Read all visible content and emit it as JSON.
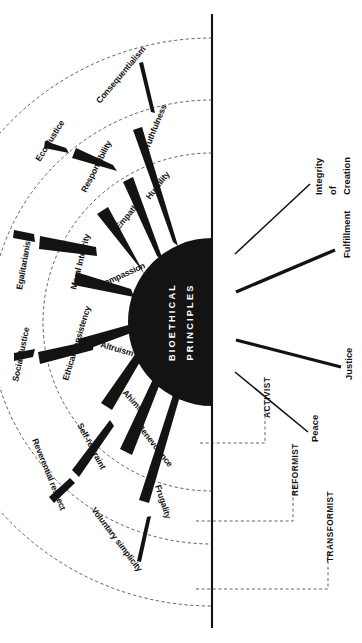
{
  "diagram": {
    "title": "Bioethical Principles",
    "hub_label_line1": "BIOETHICAL",
    "hub_label_line2": "PRINCIPLES",
    "orientation_note": "rotated 90 degrees counter-clockwise",
    "colors": {
      "ink": "#131313",
      "background": "#ffffff",
      "hub_fill": "#131313",
      "hub_text": "#ffffff",
      "dashed_arc": "#2b2b2b"
    }
  },
  "rings": {
    "inner": {
      "name": "Inner ring of virtues",
      "items": [
        {
          "label": "Truthfulness"
        },
        {
          "label": "Humility"
        },
        {
          "label": "Empathy"
        },
        {
          "label": "Compassion"
        },
        {
          "label": "Altruism"
        },
        {
          "label": "Ahimsa"
        },
        {
          "label": "Benevolence"
        },
        {
          "label": "Frugality"
        }
      ]
    },
    "middle": {
      "name": "Middle ring of principles",
      "items": [
        {
          "label": "Consequentialism"
        },
        {
          "label": "Responsibility"
        },
        {
          "label": "Moral Integrity"
        },
        {
          "label": "Ethical consistency"
        },
        {
          "label": "Self-restraint"
        },
        {
          "label": "Voluntary simplicity"
        }
      ]
    },
    "outer": {
      "name": "Outer ring of social goals",
      "items": [
        {
          "label": "Eco-Justice"
        },
        {
          "label": "Egalitarianism"
        },
        {
          "label": "Social Justice"
        },
        {
          "label": "Reverential respect"
        }
      ]
    }
  },
  "outcomes": {
    "name": "Outcome rays",
    "items": [
      {
        "label": "Integrity of Creation",
        "line1": "Integrity",
        "line2": "of",
        "line3": "Creation",
        "weight": "thin"
      },
      {
        "label": "Fulfillment",
        "line1": "Fulfillment",
        "weight": "thick"
      },
      {
        "label": "Justice",
        "line1": "Justice",
        "weight": "thick"
      },
      {
        "label": "Peace",
        "line1": "Peace",
        "weight": "thin"
      }
    ]
  },
  "pathways": {
    "name": "Change pathways",
    "items": [
      {
        "label": "ACTIVIST"
      },
      {
        "label": "REFORMIST"
      },
      {
        "label": "TRANSFORMIST"
      }
    ]
  }
}
